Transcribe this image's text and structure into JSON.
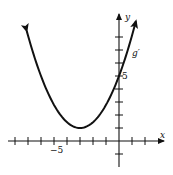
{
  "chart_data": {
    "type": "line",
    "title": "",
    "xlabel": "x",
    "ylabel": "y",
    "series": [
      {
        "name": "g'",
        "function": "(4/9)(x+3)^2 + 1",
        "x": [
          -7.1,
          -6,
          -5,
          -4,
          -3,
          -2,
          -1,
          0,
          1,
          1.3
        ],
        "values": [
          8.47,
          5.0,
          2.78,
          1.44,
          1.0,
          1.44,
          2.78,
          5.0,
          8.11,
          9.22
        ]
      }
    ],
    "vertex": {
      "x": -3,
      "y": 1
    },
    "y_intercept": 5,
    "xlim": [
      -8,
      2
    ],
    "ylim": [
      -1,
      8
    ],
    "x_ticks": [
      -8,
      -7,
      -6,
      -5,
      -4,
      -3,
      -2,
      -1,
      0,
      1,
      2
    ],
    "y_ticks": [
      -1,
      1,
      2,
      3,
      4,
      5,
      6,
      7,
      8
    ],
    "tick_labels": {
      "x": [
        "-5"
      ],
      "y": [
        "5"
      ]
    },
    "grid": false,
    "annotations": [
      "g'"
    ]
  },
  "labels": {
    "x_axis": "x",
    "y_axis": "y",
    "x_tick_label": "−5",
    "y_tick_label": "5",
    "curve_label": "g′"
  }
}
